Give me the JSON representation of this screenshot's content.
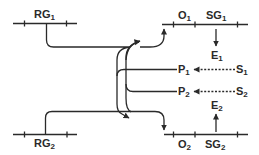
{
  "diagram": {
    "type": "genetic-regulation-schematic",
    "line_color": "#2a2a2a",
    "background": "#ffffff",
    "nodes": {
      "rg1": {
        "base": "RG",
        "sub": "1"
      },
      "rg2": {
        "base": "RG",
        "sub": "2"
      },
      "o1": {
        "base": "O",
        "sub": "1"
      },
      "o2": {
        "base": "O",
        "sub": "2"
      },
      "sg1": {
        "base": "SG",
        "sub": "1"
      },
      "sg2": {
        "base": "SG",
        "sub": "2"
      },
      "e1": {
        "base": "E",
        "sub": "1"
      },
      "e2": {
        "base": "E",
        "sub": "2"
      },
      "p1": {
        "base": "P",
        "sub": "1"
      },
      "p2": {
        "base": "P",
        "sub": "2"
      },
      "s1": {
        "base": "S",
        "sub": "1"
      },
      "s2": {
        "base": "S",
        "sub": "2"
      }
    },
    "edges": [
      {
        "from": "RG1",
        "to": "O2",
        "style": "solid",
        "arrow": "end"
      },
      {
        "from": "RG2",
        "to": "O1",
        "style": "solid",
        "arrow": "end"
      },
      {
        "from": "P1",
        "to": "O2",
        "style": "solid",
        "arrow": "end"
      },
      {
        "from": "P2",
        "to": "O1",
        "style": "solid",
        "arrow": "end"
      },
      {
        "from": "S1",
        "to": "P1",
        "style": "dashed",
        "arrow": "end"
      },
      {
        "from": "S2",
        "to": "P2",
        "style": "dashed",
        "arrow": "end"
      },
      {
        "from": "SG1",
        "to": "E1",
        "style": "solid",
        "arrow": "end"
      },
      {
        "from": "SG2",
        "to": "E2",
        "style": "solid",
        "arrow": "end"
      }
    ]
  }
}
